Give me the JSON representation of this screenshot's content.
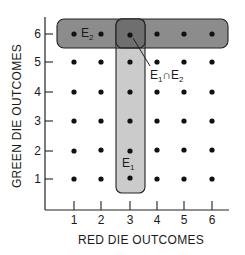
{
  "diagram": {
    "x_axis": {
      "title": "RED DIE OUTCOMES",
      "ticks": [
        "1",
        "2",
        "3",
        "4",
        "5",
        "6"
      ]
    },
    "y_axis": {
      "title": "GREEN DIE OUTCOMES",
      "ticks": [
        "1",
        "2",
        "3",
        "4",
        "5",
        "6"
      ]
    },
    "events": {
      "E1": {
        "base": "E",
        "sub": "1",
        "description": "red die shows 3",
        "fill": "#c8c8c8"
      },
      "E2": {
        "base": "E",
        "sub": "2",
        "description": "green die shows 6",
        "fill": "#8a8a8a"
      },
      "intersection": {
        "left": "E",
        "left_sub": "1",
        "op": "∩",
        "right": "E",
        "right_sub": "2",
        "fill": "#6e6e6e"
      }
    },
    "grid": {
      "rows": 6,
      "cols": 6,
      "dot_color": "#111111"
    },
    "colors": {
      "axis": "#222222",
      "border": "#222222",
      "background": "#ffffff"
    }
  }
}
